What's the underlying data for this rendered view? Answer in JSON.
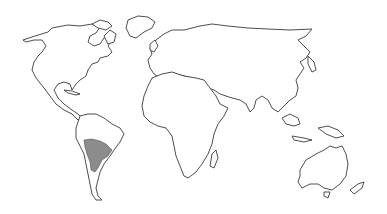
{
  "map": {
    "type": "world-outline",
    "projection": "equirectangular-like",
    "background_color": "#ffffff",
    "outline_color": "#3a3a3a",
    "land_fill": "#ffffff",
    "highlight": {
      "region": "South-central South America (Paraguay / southern Brazil / northern Argentina)",
      "fill_color": "#8c8c8c"
    },
    "continents": [
      "North America",
      "Greenland",
      "South America",
      "Europe",
      "Asia",
      "Africa",
      "Australia"
    ]
  }
}
